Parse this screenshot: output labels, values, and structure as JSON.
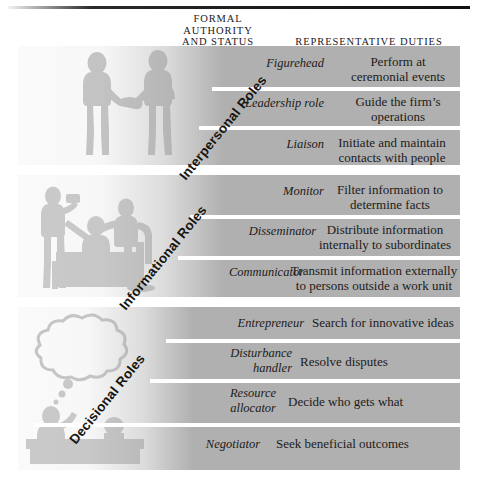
{
  "figure": {
    "title_columns": {
      "formal_authority": "FORMAL\nAUTHORITY\nAND STATUS",
      "representative_duties": "REPRESENTATIVE DUTIES"
    },
    "colors": {
      "panel_gray": "#b0b0b0",
      "separator_white": "#ffffff",
      "text_dark": "#1d1b1a",
      "rule_dark": "#1c1c1c"
    }
  },
  "sections": [
    {
      "id": "interpersonal",
      "category_label": "Interpersonal Roles",
      "illustration": "handshake-illustration",
      "rows": [
        {
          "role": "Figurehead",
          "duty": "Perform at\nceremonial events"
        },
        {
          "role": "Leadership role",
          "duty": "Guide the firm’s\noperations"
        },
        {
          "role": "Liaison",
          "duty": "Initiate and maintain\ncontacts with people"
        }
      ]
    },
    {
      "id": "informational",
      "category_label": "Informational Roles",
      "illustration": "office-meeting-illustration",
      "rows": [
        {
          "role": "Monitor",
          "duty": "Filter information to\ndetermine facts"
        },
        {
          "role": "Disseminator",
          "duty": "Distribute information\ninternally to subordinates"
        },
        {
          "role": "Communicator",
          "duty": "Transmit information externally\nto persons outside a work unit"
        }
      ]
    },
    {
      "id": "decisional",
      "category_label": "Decisional Roles",
      "illustration": "thinking-at-desk-illustration",
      "rows": [
        {
          "role": "Entrepreneur",
          "duty": "Search for innovative ideas"
        },
        {
          "role": "Disturbance\nhandler",
          "duty": "Resolve disputes"
        },
        {
          "role": "Resource\nallocator",
          "duty": "Decide who gets what"
        },
        {
          "role": "Negotiator",
          "duty": "Seek beneficial outcomes"
        }
      ]
    }
  ]
}
